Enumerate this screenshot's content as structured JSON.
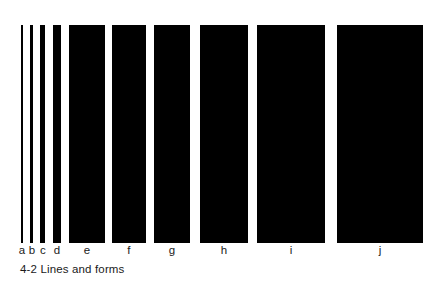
{
  "figure": {
    "caption": "4-2 Lines and forms",
    "caption_number": "4-2",
    "caption_title": "Lines and forms",
    "background_color": "#ffffff",
    "bar_color": "#000000",
    "text_color": "#1a1a1a"
  },
  "chart_data": {
    "type": "bar",
    "title": "4-2 Lines and forms",
    "xlabel": "",
    "ylabel": "",
    "orientation": "vertical",
    "grid": false,
    "legend": null,
    "note": "Ten black vertical bars of equal height and progressively increasing width, labelled a through j, illustrating the transition from line to form.",
    "categories": [
      "a",
      "b",
      "c",
      "d",
      "e",
      "f",
      "g",
      "h",
      "i",
      "j"
    ],
    "series": [
      {
        "name": "bar width (px)",
        "values": [
          2,
          3,
          5,
          8,
          36,
          34,
          36,
          48,
          68,
          86
        ]
      },
      {
        "name": "bar height (px)",
        "values": [
          218,
          218,
          218,
          218,
          218,
          218,
          218,
          218,
          218,
          218
        ]
      }
    ],
    "bars": [
      {
        "label": "a",
        "x": 21,
        "width": 2,
        "top": 25,
        "height": 218,
        "label_center": 22
      },
      {
        "label": "b",
        "x": 30,
        "width": 3,
        "top": 25,
        "height": 218,
        "label_center": 32
      },
      {
        "label": "c",
        "x": 40,
        "width": 5,
        "top": 25,
        "height": 218,
        "label_center": 43
      },
      {
        "label": "d",
        "x": 53,
        "width": 8,
        "top": 25,
        "height": 218,
        "label_center": 57
      },
      {
        "label": "e",
        "x": 69,
        "width": 36,
        "top": 25,
        "height": 218,
        "label_center": 87
      },
      {
        "label": "f",
        "x": 112,
        "width": 34,
        "top": 25,
        "height": 218,
        "label_center": 129
      },
      {
        "label": "g",
        "x": 154,
        "width": 36,
        "top": 25,
        "height": 218,
        "label_center": 172
      },
      {
        "label": "h",
        "x": 200,
        "width": 48,
        "top": 25,
        "height": 218,
        "label_center": 224
      },
      {
        "label": "i",
        "x": 257,
        "width": 68,
        "top": 25,
        "height": 218,
        "label_center": 291
      },
      {
        "label": "j",
        "x": 337,
        "width": 86,
        "top": 25,
        "height": 218,
        "label_center": 380
      }
    ],
    "xlim": [
      0,
      443
    ],
    "ylim": [
      0,
      284
    ]
  }
}
